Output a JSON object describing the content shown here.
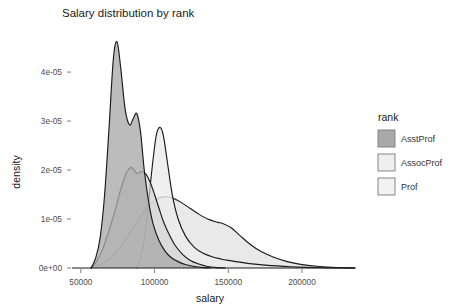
{
  "chart_data": {
    "type": "area",
    "title": "Salary distribution by rank",
    "xlabel": "salary",
    "ylabel": "density",
    "xlim": [
      44000,
      238000
    ],
    "ylim": [
      0,
      4.9e-05
    ],
    "grid": false,
    "legend_position": "right",
    "legend_title": "rank",
    "xticks": [
      50000,
      100000,
      150000,
      200000
    ],
    "xticklabels": [
      "50000",
      "100000",
      "150000",
      "200000"
    ],
    "yticks": [
      0,
      1e-05,
      2e-05,
      3e-05,
      4e-05
    ],
    "yticklabels": [
      "0e+00",
      "1e-05",
      "2e-05",
      "3e-05",
      "4e-05"
    ],
    "series": [
      {
        "name": "AsstProf",
        "color": "#a9a9a9",
        "fill_opacity": 0.78,
        "line_color": "#1a1a1a",
        "x": [
          57000,
          60000,
          63000,
          66000,
          69000,
          72000,
          74500,
          77000,
          80000,
          83000,
          85500,
          88000,
          90500,
          93000,
          96000,
          99000,
          103000,
          107000,
          111000,
          116000,
          121000,
          127000,
          133000,
          138000
        ],
        "y": [
          0.0,
          2e-06,
          6e-06,
          1.45e-05,
          2.8e-05,
          4.25e-05,
          4.62e-05,
          4.1e-05,
          3.25e-05,
          2.92e-05,
          3.05e-05,
          3.15e-05,
          2.78e-05,
          2e-05,
          1.35e-05,
          9e-06,
          5.6e-06,
          3.5e-06,
          2.2e-06,
          1.3e-06,
          7e-07,
          3e-07,
          8e-08,
          0.0
        ]
      },
      {
        "name": "AssocProf",
        "color": "#d4d4d4",
        "fill_opacity": 0.72,
        "line_color": "#1a1a1a",
        "x": [
          57000,
          61000,
          65000,
          69000,
          73000,
          77000,
          81000,
          84500,
          88000,
          91000,
          94000,
          97000,
          100000,
          103000,
          106000,
          110000,
          114000,
          119000,
          124000,
          130000,
          136000,
          142000,
          148000
        ],
        "y": [
          0.0,
          1.5e-06,
          4e-06,
          7.5e-06,
          1.15e-05,
          1.6e-05,
          1.95e-05,
          2.05e-05,
          1.93e-05,
          1.97e-05,
          1.92e-05,
          1.75e-05,
          1.5e-05,
          1.22e-05,
          9.5e-06,
          6.8e-06,
          4.6e-06,
          2.8e-06,
          1.6e-06,
          8e-07,
          3e-07,
          8e-08,
          0.0
        ]
      },
      {
        "name": "Prof",
        "color": "#ebebeb",
        "fill_opacity": 0.82,
        "line_color": "#1a1a1a",
        "x": [
          88000,
          92000,
          95000,
          98000,
          101000,
          103500,
          106000,
          109000,
          112000,
          116000,
          121000,
          127000,
          133000,
          139000,
          145000,
          150000,
          155000,
          161000,
          168000,
          175000,
          183000,
          192000,
          202000,
          213000,
          225000,
          236000
        ],
        "y": [
          0.0,
          4e-06,
          1.05e-05,
          1.95e-05,
          2.68e-05,
          2.87e-05,
          2.7e-05,
          2.1e-05,
          1.5e-05,
          1e-05,
          6.5e-06,
          4.2e-06,
          3e-06,
          2.3e-06,
          1.85e-06,
          1.55e-06,
          1.3e-06,
          1.05e-06,
          8e-07,
          6e-07,
          4.2e-07,
          2.6e-07,
          1.4e-07,
          6e-08,
          2e-08,
          0.0
        ]
      },
      {
        "name": "ProfBroad",
        "color": "#e3e3e3",
        "fill_opacity": 0.8,
        "line_color": "#1a1a1a",
        "x": [
          57000,
          62000,
          68000,
          74000,
          80000,
          86000,
          92000,
          98000,
          104000,
          109000,
          113000,
          118000,
          124000,
          130000,
          136000,
          142000,
          147000,
          152000,
          158000,
          165000,
          172000,
          180000,
          190000,
          200000,
          212000,
          224000,
          236000
        ],
        "y": [
          0.0,
          6e-07,
          1.6e-06,
          3.2e-06,
          5.6e-06,
          8.4e-06,
          1.12e-05,
          1.33e-05,
          1.44e-05,
          1.45e-05,
          1.42e-05,
          1.34e-05,
          1.22e-05,
          1.1e-05,
          1e-05,
          9.4e-06,
          9e-06,
          8.2e-06,
          6.6e-06,
          4.8e-06,
          3.4e-06,
          2.3e-06,
          1.3e-06,
          7e-07,
          3e-07,
          1e-07,
          0.0
        ]
      }
    ],
    "legend_entries": [
      {
        "label": "AsstProf",
        "color": "#a9a9a9"
      },
      {
        "label": "AssocProf",
        "color": "#efefef"
      },
      {
        "label": "Prof",
        "color": "#f2f2f2"
      }
    ]
  }
}
